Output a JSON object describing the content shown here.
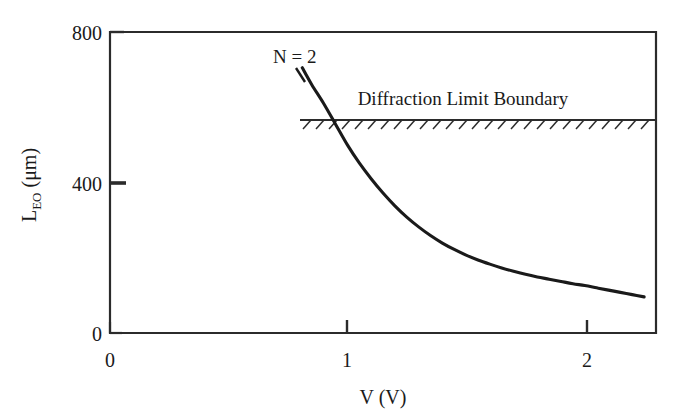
{
  "chart_data": {
    "type": "line",
    "title": "",
    "xlabel": "V (V)",
    "ylabel": "L_EO (μm)",
    "ylabel_base": "L",
    "ylabel_sub": "EO",
    "ylabel_unit": " (μm)",
    "xlim": [
      0,
      2.3
    ],
    "ylim": [
      0,
      800
    ],
    "xticks": [
      0,
      1,
      2
    ],
    "xticklabels": [
      "0",
      "1",
      "2"
    ],
    "yticks": [
      0,
      400,
      800
    ],
    "yticklabels": [
      "0",
      "400",
      "800"
    ],
    "grid": false,
    "legend": "none",
    "line_color": "#1a1a1a",
    "axis_color": "#2b2b2b",
    "background": "#ffffff",
    "series": [
      {
        "name": "N = 2",
        "label": "N = 2",
        "label_x": 0.84,
        "label_y": 765,
        "x": [
          0.81,
          0.85,
          0.9,
          0.95,
          1.0,
          1.05,
          1.1,
          1.15,
          1.2,
          1.25,
          1.3,
          1.35,
          1.4,
          1.45,
          1.5,
          1.55,
          1.6,
          1.65,
          1.7,
          1.75,
          1.8,
          1.85,
          1.9,
          1.95,
          2.0,
          2.05,
          2.1,
          2.15,
          2.2,
          2.25
        ],
        "y": [
          705,
          660,
          610,
          555,
          500,
          452,
          410,
          372,
          338,
          308,
          282,
          259,
          239,
          222,
          207,
          194,
          183,
          173,
          164,
          156,
          149,
          143,
          137,
          131,
          126,
          120,
          114,
          108,
          102,
          96
        ]
      }
    ],
    "annotations": [
      {
        "name": "diffraction-limit-boundary",
        "text": "Diffraction Limit Boundary",
        "text_x": 1.49,
        "text_y": 640,
        "line_y": 565,
        "line_x_start": 0.8,
        "line_x_end": 2.3,
        "hatch_side": "below",
        "hatch_count": 28
      }
    ],
    "intersections": [
      {
        "name": "curve-boundary-crossing",
        "x": 0.93,
        "y": 565
      }
    ]
  }
}
